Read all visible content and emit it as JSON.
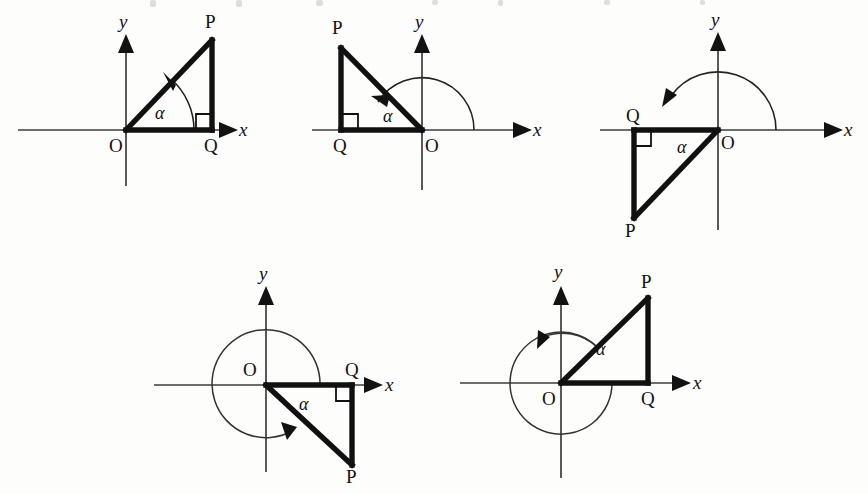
{
  "page": {
    "background_color": "#fdfdfc",
    "ink_color": "#121212",
    "width": 868,
    "height": 493
  },
  "labels": {
    "origin": "O",
    "foot": "Q",
    "terminal": "P",
    "x_axis": "x",
    "y_axis": "y",
    "angle": "α"
  },
  "diagrams": [
    {
      "id": "diagram-1",
      "name": "quadrant-i-acute-angle",
      "quadrant": "I",
      "angle_label": "α",
      "arc_kind": "small-arc",
      "origin_label": "O",
      "foot_label": "Q",
      "terminal_label": "P",
      "x_label": "x",
      "y_label": "y"
    },
    {
      "id": "diagram-2",
      "name": "quadrant-ii-obtuse-angle",
      "quadrant": "II",
      "angle_label": "α",
      "arc_kind": "semicircle-arc",
      "origin_label": "O",
      "foot_label": "Q",
      "terminal_label": "P",
      "x_label": "x",
      "y_label": "y"
    },
    {
      "id": "diagram-3",
      "name": "quadrant-iii-reflex-angle",
      "quadrant": "III",
      "angle_label": "α",
      "arc_kind": "over-semicircle-arc",
      "origin_label": "O",
      "foot_label": "Q",
      "terminal_label": "P",
      "x_label": "x",
      "y_label": "y"
    },
    {
      "id": "diagram-4",
      "name": "quadrant-iv-reflex-angle",
      "quadrant": "IV",
      "angle_label": "α",
      "arc_kind": "near-full-circle-arc",
      "origin_label": "O",
      "foot_label": "Q",
      "terminal_label": "P",
      "x_label": "x",
      "y_label": "y"
    },
    {
      "id": "diagram-5",
      "name": "quadrant-i-coterminal-angle",
      "quadrant": "I",
      "angle_label": "α",
      "arc_kind": "full-circle-plus-arc",
      "origin_label": "O",
      "foot_label": "Q",
      "terminal_label": "P",
      "x_label": "x",
      "y_label": "y"
    }
  ]
}
